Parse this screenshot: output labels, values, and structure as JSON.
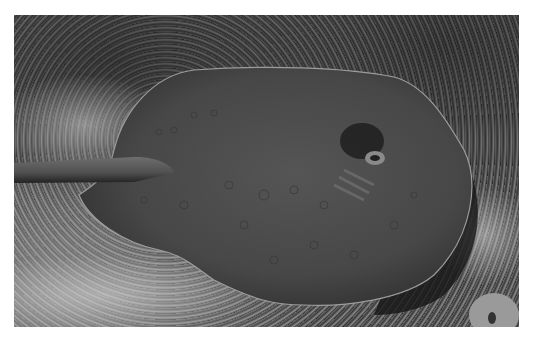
{
  "image": {
    "subject": "stingray resting on gravelly seabed",
    "style": "black-and-white photograph",
    "colors": {
      "background": "#ffffff",
      "seabed_dark": "#2e2e2e",
      "seabed_light": "#9a9a9a",
      "ray_body": "#4a4a4a",
      "ray_edge": "#9c9c9c",
      "shadow": "#151515"
    }
  }
}
